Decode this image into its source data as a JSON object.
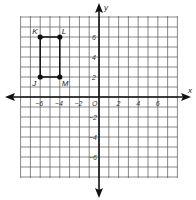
{
  "diagram": {
    "type": "coordinate-plane",
    "axes": {
      "x_label": "x",
      "y_label": "y",
      "origin_label": "O",
      "range": [
        -8,
        8
      ],
      "x_tick_labels": [
        "-6",
        "-4",
        "-2",
        "2",
        "4",
        "6"
      ],
      "y_tick_labels": [
        "6",
        "4",
        "2",
        "-2",
        "-4",
        "-6"
      ]
    },
    "points": [
      {
        "name": "K",
        "x": -6,
        "y": 6
      },
      {
        "name": "L",
        "x": -4,
        "y": 6
      },
      {
        "name": "M",
        "x": -4,
        "y": 2
      },
      {
        "name": "J",
        "x": -6,
        "y": 2
      }
    ],
    "shape": {
      "name": "rectangle JKLM",
      "vertices": [
        "K",
        "L",
        "M",
        "J"
      ]
    },
    "colors": {
      "grid": "#555555",
      "axis": "#111111",
      "point": "#111111"
    }
  }
}
